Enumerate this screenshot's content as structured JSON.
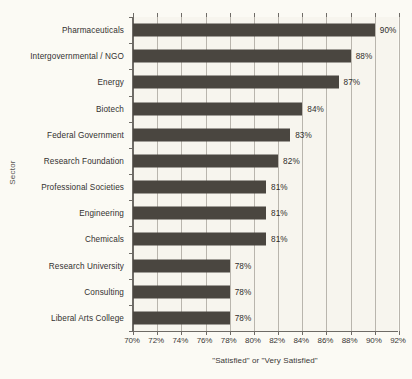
{
  "chart_data": {
    "type": "bar",
    "orientation": "horizontal",
    "title": "",
    "xlabel": "\"Satisfied\" or \"Very Satisfied\"",
    "ylabel": "Sector",
    "xlim": [
      70,
      92
    ],
    "xtick_labels": [
      "70%",
      "72%",
      "74%",
      "76%",
      "78%",
      "80%",
      "82%",
      "84%",
      "86%",
      "88%",
      "90%",
      "92%"
    ],
    "xticks": [
      70,
      72,
      74,
      76,
      78,
      80,
      82,
      84,
      86,
      88,
      90,
      92
    ],
    "grid": true,
    "legend": "none",
    "categories": [
      "Pharmaceuticals",
      "Intergovernmental / NGO",
      "Energy",
      "Biotech",
      "Federal Government",
      "Research Foundation",
      "Professional Societies",
      "Engineering",
      "Chemicals",
      "Research University",
      "Consulting",
      "Liberal Arts College"
    ],
    "values": [
      90,
      88,
      87,
      84,
      83,
      82,
      81,
      81,
      81,
      78,
      78,
      78
    ],
    "value_labels": [
      "90%",
      "88%",
      "87%",
      "84%",
      "83%",
      "82%",
      "81%",
      "81%",
      "81%",
      "78%",
      "78%",
      "78%"
    ],
    "colors": {
      "bar": "#4a4640",
      "background": "#fbfaf4",
      "plot_background": "#f7f5ee",
      "gridline": "#b9b5ad",
      "axis": "#6e6b66",
      "text": "#2f2d2b"
    }
  }
}
